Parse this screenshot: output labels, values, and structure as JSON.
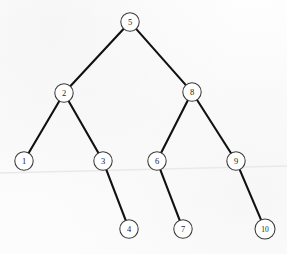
{
  "figure": {
    "name": "binary-search-tree-diagram",
    "type": "tree",
    "background_color": "#fdfdfd",
    "edge_color": "#111111",
    "node_fill_color": "#ffffff",
    "node_stroke_color": "#3a3a3a"
  },
  "tree": {
    "root_value": "5",
    "node_count": 10,
    "depth": 4,
    "nodes": [
      {
        "id": "n5",
        "label": "5",
        "cx": 130,
        "cy": 22,
        "r": 9.2,
        "level": 0,
        "wide": false
      },
      {
        "id": "n2",
        "label": "2",
        "cx": 64,
        "cy": 93,
        "r": 9.2,
        "level": 1,
        "wide": false
      },
      {
        "id": "n8",
        "label": "8",
        "cx": 192,
        "cy": 92,
        "r": 9.2,
        "level": 1,
        "wide": false
      },
      {
        "id": "n1",
        "label": "1",
        "cx": 24,
        "cy": 161,
        "r": 9.2,
        "level": 2,
        "wide": false
      },
      {
        "id": "n3",
        "label": "3",
        "cx": 103,
        "cy": 161,
        "r": 9.2,
        "level": 2,
        "wide": false
      },
      {
        "id": "n6",
        "label": "6",
        "cx": 157,
        "cy": 161,
        "r": 9.2,
        "level": 2,
        "wide": false
      },
      {
        "id": "n9",
        "label": "9",
        "cx": 236,
        "cy": 161,
        "r": 9.2,
        "level": 2,
        "wide": false
      },
      {
        "id": "n4",
        "label": "4",
        "cx": 129,
        "cy": 229,
        "r": 9.2,
        "level": 3,
        "wide": false
      },
      {
        "id": "n7",
        "label": "7",
        "cx": 183,
        "cy": 229,
        "r": 9.2,
        "level": 3,
        "wide": false
      },
      {
        "id": "n10",
        "label": "10",
        "cx": 265,
        "cy": 229,
        "r": 10.0,
        "level": 3,
        "wide": true
      }
    ],
    "edges": [
      {
        "id": "e5-2",
        "from": "n5",
        "to": "n2",
        "from_label": "5",
        "to_label": "2",
        "side": "left"
      },
      {
        "id": "e5-8",
        "from": "n5",
        "to": "n8",
        "from_label": "5",
        "to_label": "8",
        "side": "right"
      },
      {
        "id": "e2-1",
        "from": "n2",
        "to": "n1",
        "from_label": "2",
        "to_label": "1",
        "side": "left"
      },
      {
        "id": "e2-3",
        "from": "n2",
        "to": "n3",
        "from_label": "2",
        "to_label": "3",
        "side": "right"
      },
      {
        "id": "e8-6",
        "from": "n8",
        "to": "n6",
        "from_label": "8",
        "to_label": "6",
        "side": "left"
      },
      {
        "id": "e8-9",
        "from": "n8",
        "to": "n9",
        "from_label": "8",
        "to_label": "9",
        "side": "right"
      },
      {
        "id": "e3-4",
        "from": "n3",
        "to": "n4",
        "from_label": "3",
        "to_label": "4",
        "side": "right"
      },
      {
        "id": "e6-7",
        "from": "n6",
        "to": "n7",
        "from_label": "6",
        "to_label": "7",
        "side": "left"
      },
      {
        "id": "e9-10",
        "from": "n9",
        "to": "n10",
        "from_label": "9",
        "to_label": "10",
        "side": "right"
      }
    ]
  },
  "artifacts": {
    "crease_line": {
      "name": "paper-crease",
      "x1": 0,
      "y1": 173,
      "x2": 287,
      "y2": 166,
      "color": "#e9e9ec"
    }
  }
}
